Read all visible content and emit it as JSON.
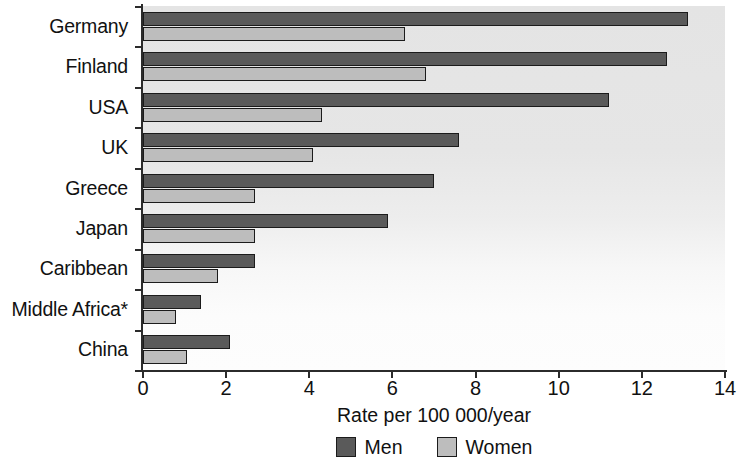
{
  "chart_data": {
    "type": "bar",
    "orientation": "horizontal",
    "title": "",
    "xlabel": "Rate per 100 000/year",
    "ylabel": "",
    "xlim": [
      0,
      14
    ],
    "xticks": [
      0,
      2,
      4,
      6,
      8,
      10,
      12,
      14
    ],
    "xtick_labels": [
      "0",
      "2",
      "4",
      "6",
      "8",
      "10",
      "12",
      "14"
    ],
    "grid": false,
    "legend_position": "bottom-center",
    "categories": [
      "Germany",
      "Finland",
      "USA",
      "UK",
      "Greece",
      "Japan",
      "Caribbean",
      "Middle Africa*",
      "China"
    ],
    "series": [
      {
        "name": "Men",
        "color": "#5a5a5a",
        "values": [
          13.1,
          12.6,
          11.2,
          7.6,
          7.0,
          5.9,
          2.7,
          1.4,
          2.1
        ]
      },
      {
        "name": "Women",
        "color": "#bdbdbd",
        "values": [
          6.3,
          6.8,
          4.3,
          4.1,
          2.7,
          2.7,
          1.8,
          0.8,
          1.05
        ]
      }
    ]
  },
  "legend": {
    "items": [
      {
        "label": "Men",
        "color": "#5a5a5a"
      },
      {
        "label": "Women",
        "color": "#bdbdbd"
      }
    ]
  },
  "colors": {
    "men": "#5a5a5a",
    "women": "#bdbdbd",
    "axis": "#2b2b2b",
    "plot_background": "#e6e6e6",
    "page_background": "#ffffff"
  }
}
